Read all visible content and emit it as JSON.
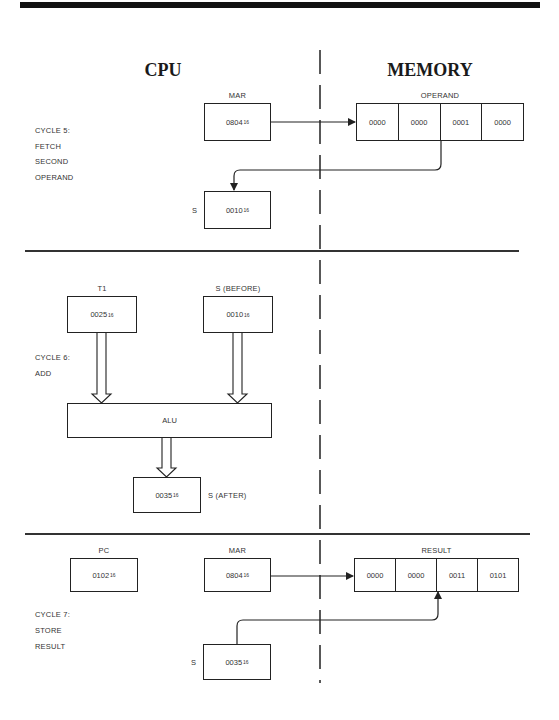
{
  "headings": {
    "cpu": "CPU",
    "memory": "MEMORY"
  },
  "subscript": "16",
  "cycle5": {
    "labels": [
      "CYCLE 5:",
      "FETCH",
      "SECOND",
      "OPERAND"
    ],
    "mar": {
      "label": "MAR",
      "value": "0804"
    },
    "operand": {
      "label": "OPERAND",
      "cells": [
        "0000",
        "0000",
        "0001",
        "0000"
      ]
    },
    "s": {
      "label": "S",
      "value": "0010"
    }
  },
  "cycle6": {
    "labels": [
      "CYCLE 6:",
      "ADD"
    ],
    "t1": {
      "label": "T1",
      "value": "0025"
    },
    "s_before": {
      "label": "S (BEFORE)",
      "value": "0010"
    },
    "alu": {
      "label": "ALU"
    },
    "s_after": {
      "label": "S (AFTER)",
      "value": "0035"
    }
  },
  "cycle7": {
    "labels": [
      "CYCLE 7:",
      "STORE",
      "RESULT"
    ],
    "pc": {
      "label": "PC",
      "value": "0102"
    },
    "mar": {
      "label": "MAR",
      "value": "0804"
    },
    "result": {
      "label": "RESULT",
      "cells": [
        "0000",
        "0000",
        "0011",
        "0101"
      ]
    },
    "s": {
      "label": "S",
      "value": "0035"
    }
  },
  "colors": {
    "line": "#222222",
    "text": "#333333",
    "background": "#ffffff"
  }
}
